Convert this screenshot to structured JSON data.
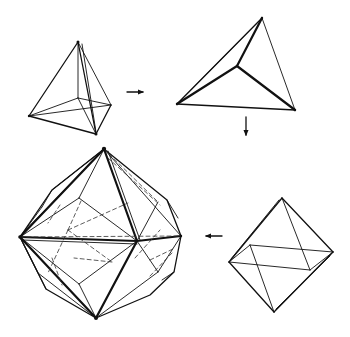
{
  "diagram": {
    "colors": {
      "line": "#111111",
      "background": "#ffffff"
    },
    "figures": [
      {
        "id": "tetrahedron",
        "position": "top-left"
      },
      {
        "id": "tetrahedron-top-view",
        "position": "top-right"
      },
      {
        "id": "octahedron",
        "position": "bottom-right"
      },
      {
        "id": "compound-polyhedron",
        "position": "bottom-left"
      }
    ],
    "arrows": [
      {
        "from": "tetrahedron",
        "to": "tetrahedron-top-view",
        "direction": "right"
      },
      {
        "from": "tetrahedron-top-view",
        "to": "octahedron",
        "direction": "down"
      },
      {
        "from": "octahedron",
        "to": "compound-polyhedron",
        "direction": "left"
      }
    ]
  }
}
